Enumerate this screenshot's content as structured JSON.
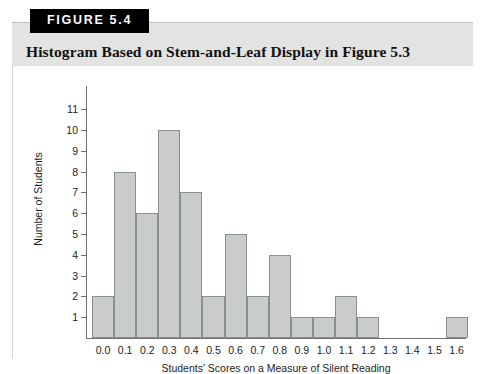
{
  "figure": {
    "badge_label": "FIGURE 5.4",
    "title": "Histogram Based on Stem-and-Leaf Display in Figure 5.3"
  },
  "colors": {
    "bar_fill": "#c9ccca",
    "bar_stroke": "#87908c",
    "header_band": "#e3e3e1",
    "badge_background": "#000000",
    "badge_text": "#ffffff",
    "axis": "#6f6f6f"
  },
  "chart_data": {
    "type": "bar",
    "title": "Histogram Based on Stem-and-Leaf Display in Figure 5.3",
    "xlabel": "Students' Scores on a Measure of Silent Reading",
    "ylabel": "Number of Students",
    "categories": [
      "0.0",
      "0.1",
      "0.2",
      "0.3",
      "0.4",
      "0.5",
      "0.6",
      "0.7",
      "0.8",
      "0.9",
      "1.0",
      "1.1",
      "1.2",
      "1.3",
      "1.4",
      "1.5",
      "1.6"
    ],
    "values": [
      2,
      8,
      6,
      10,
      7,
      2,
      5,
      2,
      4,
      1,
      1,
      2,
      1,
      0,
      0,
      0,
      1
    ],
    "ylim": [
      0,
      11.6
    ],
    "yticks": [
      11,
      10,
      9,
      8,
      7,
      6,
      5,
      4,
      3,
      2,
      1
    ],
    "ytick_labels": [
      "11",
      "10",
      "9",
      "8",
      "7",
      "6",
      "5",
      "4",
      "3",
      "2",
      "1"
    ],
    "xtick_labels": [
      "0.0",
      "0.1",
      "0.2",
      "0.3",
      "0.4",
      "0.5",
      "0.6",
      "0.7",
      "0.8",
      "0.9",
      "1.0",
      "1.1",
      "1.2",
      "1.3",
      "1.4",
      "1.5",
      "1.6"
    ],
    "grid": false,
    "legend": false
  }
}
